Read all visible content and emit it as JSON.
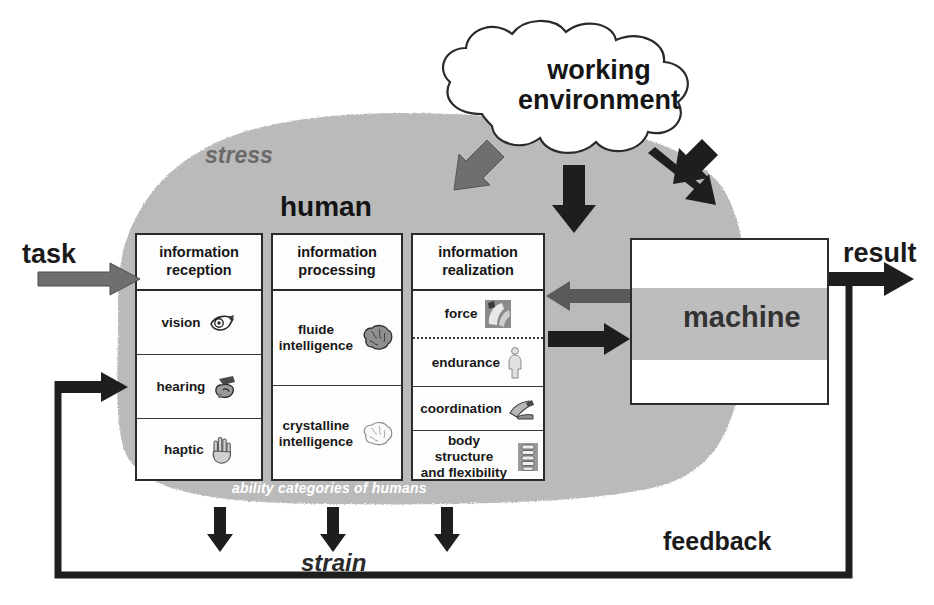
{
  "diagram": {
    "colors": {
      "stress_blob": "#b5b5b5",
      "machine_band": "#bdbdbd",
      "arrow_black": "#1e1e1e",
      "arrow_gray": "#6f6f6f",
      "box_border": "#2a2a2a",
      "caption_text": "#ffffff"
    }
  },
  "cloud": {
    "label": "working\nenvironment",
    "line1": "working",
    "line2": "environment"
  },
  "labels": {
    "task": "task",
    "result": "result",
    "feedback": "feedback",
    "strain": "strain",
    "stress": "stress",
    "human": "human",
    "machine": "machine",
    "ability_caption": "ability categories of humans"
  },
  "columns": [
    {
      "id": "information-reception",
      "header_line1": "information",
      "header_line2": "reception",
      "rows": [
        {
          "label": "vision",
          "icon": "eye-icon"
        },
        {
          "label": "hearing",
          "icon": "ear-icon"
        },
        {
          "label": "haptic",
          "icon": "hand-icon"
        }
      ]
    },
    {
      "id": "information-processing",
      "header_line1": "information",
      "header_line2": "processing",
      "rows": [
        {
          "label_line1": "fluide",
          "label_line2": "intelligence",
          "icon": "brain-icon"
        },
        {
          "label_line1": "crystalline",
          "label_line2": "intelligence",
          "icon": "brain-outline-icon"
        }
      ]
    },
    {
      "id": "information-realization",
      "header_line1": "information",
      "header_line2": "realization",
      "rows": [
        {
          "label": "force",
          "icon": "muscle-icon"
        },
        {
          "label": "endurance",
          "icon": "person-icon"
        },
        {
          "label": "coordination",
          "icon": "hand-tool-icon"
        },
        {
          "label_line1": "body structure",
          "label_line2": "and flexibility",
          "icon": "spine-icon"
        }
      ]
    }
  ],
  "arrows": [
    {
      "name": "task-arrow",
      "direction": "right",
      "color": "gray"
    },
    {
      "name": "cloud-to-human-arrow",
      "direction": "down-left",
      "color": "gray"
    },
    {
      "name": "cloud-to-middle-arrow",
      "direction": "down",
      "color": "black"
    },
    {
      "name": "cloud-to-machine-arrow",
      "direction": "down-right",
      "color": "black"
    },
    {
      "name": "machine-to-human-arrow",
      "direction": "left",
      "color": "gray"
    },
    {
      "name": "human-to-machine-arrow",
      "direction": "right",
      "color": "black"
    },
    {
      "name": "result-arrow",
      "direction": "right",
      "color": "black"
    },
    {
      "name": "strain-arrow-1",
      "direction": "down",
      "color": "black"
    },
    {
      "name": "strain-arrow-2",
      "direction": "down",
      "color": "black"
    },
    {
      "name": "strain-arrow-3",
      "direction": "down",
      "color": "black"
    },
    {
      "name": "feedback-arrow",
      "direction": "right",
      "color": "black"
    }
  ]
}
